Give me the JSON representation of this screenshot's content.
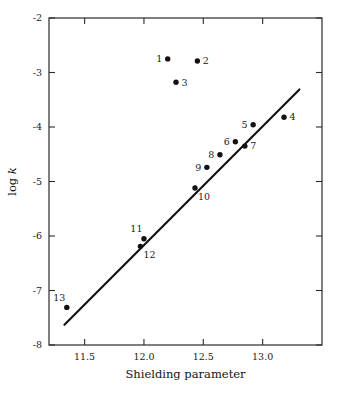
{
  "chart_data": {
    "type": "scatter",
    "title": "",
    "xlabel": "Shielding parameter",
    "ylabel": "log k",
    "ylabel_parts": {
      "prefix": "log ",
      "italic": "k"
    },
    "xlim": [
      11.2,
      13.5
    ],
    "ylim": [
      -8,
      -2
    ],
    "xticks": [
      11.5,
      12.0,
      12.5,
      13.0
    ],
    "xtick_labels": [
      "11.5",
      "12.0",
      "12.5",
      "13.0"
    ],
    "yticks": [
      -2,
      -3,
      -4,
      -5,
      -6,
      -7,
      -8
    ],
    "ytick_labels": [
      "-2",
      "-3",
      "-4",
      "-5",
      "-6",
      "-7",
      "-8"
    ],
    "grid": false,
    "legend": false,
    "marker_color": "#121212",
    "line_color": "#111111",
    "axis_color": "#2b2b2b",
    "background_color": "#ffffff",
    "points": [
      {
        "label": "1",
        "x": 12.2,
        "y": -2.75,
        "label_pos": "left"
      },
      {
        "label": "2",
        "x": 12.45,
        "y": -2.79,
        "label_pos": "right"
      },
      {
        "label": "3",
        "x": 12.27,
        "y": -3.18,
        "label_pos": "right"
      },
      {
        "label": "4",
        "x": 13.18,
        "y": -3.82,
        "label_pos": "right"
      },
      {
        "label": "5",
        "x": 12.92,
        "y": -3.96,
        "label_pos": "left"
      },
      {
        "label": "6",
        "x": 12.77,
        "y": -4.27,
        "label_pos": "left"
      },
      {
        "label": "7",
        "x": 12.85,
        "y": -4.35,
        "label_pos": "right"
      },
      {
        "label": "8",
        "x": 12.64,
        "y": -4.51,
        "label_pos": "left"
      },
      {
        "label": "9",
        "x": 12.53,
        "y": -4.74,
        "label_pos": "left"
      },
      {
        "label": "10",
        "x": 12.43,
        "y": -5.12,
        "label_pos": "below-right"
      },
      {
        "label": "11",
        "x": 12.0,
        "y": -6.05,
        "label_pos": "above-left"
      },
      {
        "label": "12",
        "x": 11.97,
        "y": -6.19,
        "label_pos": "below-right"
      },
      {
        "label": "13",
        "x": 11.35,
        "y": -7.31,
        "label_pos": "above-left"
      }
    ],
    "fit_line": {
      "x1": 11.33,
      "y1": -7.63,
      "x2": 13.31,
      "y2": -3.31
    }
  }
}
